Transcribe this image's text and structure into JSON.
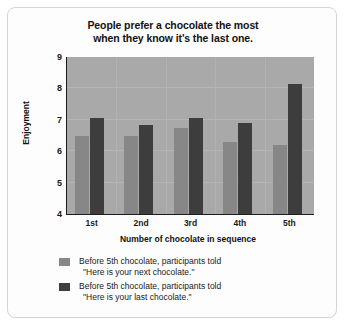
{
  "chart_data": {
    "type": "bar",
    "title": "People prefer a chocolate the most when they know it's the last one.",
    "title_lines": [
      "People prefer a chocolate the most",
      "when they know it's the last one."
    ],
    "xlabel": "Number of chocolate in sequence",
    "ylabel": "Enjoyment",
    "categories": [
      "1st",
      "2nd",
      "3rd",
      "4th",
      "5th"
    ],
    "ylim": [
      4,
      9
    ],
    "yticks": [
      4,
      5,
      6,
      7,
      8,
      9
    ],
    "ytick_labels": [
      "4",
      "5",
      "6",
      "7",
      "8",
      "9"
    ],
    "grid": true,
    "legend_position": "below-axes-left",
    "series": [
      {
        "name": "Before 5th chocolate, participants told \"Here is your next chocolate.\"",
        "label_lines": [
          "Before 5th chocolate, participants told",
          "\"Here is your next chocolate.\""
        ],
        "color": "#878787",
        "values": [
          6.5,
          6.5,
          6.75,
          6.3,
          6.2
        ]
      },
      {
        "name": "Before 5th chocolate, participants told \"Here is your last chocolate.\"",
        "label_lines": [
          "Before 5th chocolate, participants told",
          "\"Here is your last chocolate.\""
        ],
        "color": "#3d3d3d",
        "values": [
          7.05,
          6.85,
          7.05,
          6.9,
          8.15
        ]
      }
    ],
    "plot_background": "#a9a9a9",
    "figure_background": "#fdfdfd"
  }
}
